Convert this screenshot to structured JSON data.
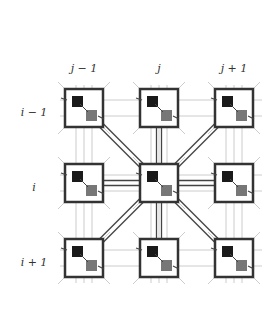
{
  "diagram": {
    "column_labels": [
      "j − 1",
      "j",
      "j + 1"
    ],
    "row_labels": [
      "i − 1",
      "i",
      "i + 1"
    ],
    "columns_x": [
      84,
      159,
      234
    ],
    "rows_y": [
      108,
      183,
      258
    ],
    "box_size": 38,
    "center_cell": {
      "row": 1,
      "col": 1
    },
    "colors": {
      "box_border": "#333333",
      "dark_square": "#1a1a1a",
      "gray_square": "#777777",
      "grid": "#cccccc",
      "link": "#444444"
    }
  }
}
